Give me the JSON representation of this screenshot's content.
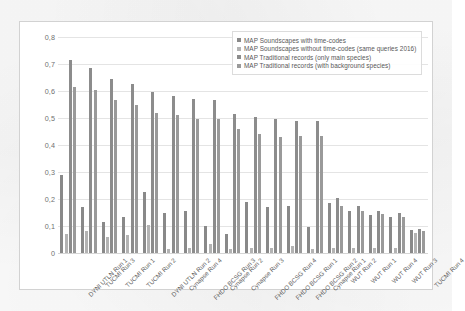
{
  "chart_data": {
    "type": "bar",
    "title": "",
    "subtitle": "",
    "xlabel": "",
    "ylabel": "",
    "ylim": [
      0,
      0.8
    ],
    "grid": true,
    "legend_position": "top-right",
    "ytick_labels": [
      "0,8",
      "0,7",
      "0,6",
      "0,5",
      "0,4",
      "0,3",
      "0,2",
      "0,1",
      "0"
    ],
    "ytick_values": [
      0.8,
      0.7,
      0.6,
      0.5,
      0.4,
      0.3,
      0.2,
      0.1,
      0
    ],
    "categories": [
      "DYNI UTLN Run 1",
      "TUCMI Run 3",
      "TUCMI Run 1",
      "TUCMI Run 2",
      "DYNI UTLN Run 2",
      "Cynapse Run 4",
      "FHDO BCSG Run 3",
      "Cynapse Run 2",
      "Cynapse Run 3",
      "FHDO BCSG Run 4",
      "FHDO BCSG Run 1",
      "FHDO BCSG Run 2",
      "Cynapse Run 1",
      "WUT Run 2",
      "WUT Run 1",
      "WUT Run 4",
      "WUT Run 3",
      "TUCMI Run 4"
    ],
    "series": [
      {
        "name": "MAP Soundscapes with time-codes",
        "color": "#898989",
        "values": [
          0.29,
          0.17,
          0.115,
          0.135,
          0.225,
          0.15,
          0.155,
          0.1,
          0.07,
          0.19,
          0.17,
          0.175,
          0.095,
          0.185,
          0.155,
          0.14,
          0.135,
          0.085
        ]
      },
      {
        "name": "MAP Soundscapes without time-codes (same queries 2016)",
        "color": "#b3b3b3",
        "values": [
          0.07,
          0.08,
          0.06,
          0.065,
          0.105,
          0.015,
          0.02,
          0.035,
          0.015,
          0.02,
          0.02,
          0.025,
          0.015,
          0.02,
          0.02,
          0.02,
          0.02,
          0.075
        ]
      },
      {
        "name": "MAP Traditional records (only main species)",
        "color": "#8c8c8c",
        "values": [
          0.715,
          0.685,
          0.645,
          0.625,
          0.595,
          0.58,
          0.57,
          0.565,
          0.515,
          0.505,
          0.495,
          0.49,
          0.49,
          0.205,
          0.175,
          0.155,
          0.15,
          0.09
        ]
      },
      {
        "name": "MAP Traditional records (with background species)",
        "color": "#9a9a9a",
        "values": [
          0.615,
          0.605,
          0.565,
          0.55,
          0.52,
          0.51,
          0.495,
          0.495,
          0.46,
          0.44,
          0.43,
          0.435,
          0.435,
          0.175,
          0.155,
          0.145,
          0.135,
          0.08
        ]
      }
    ]
  }
}
